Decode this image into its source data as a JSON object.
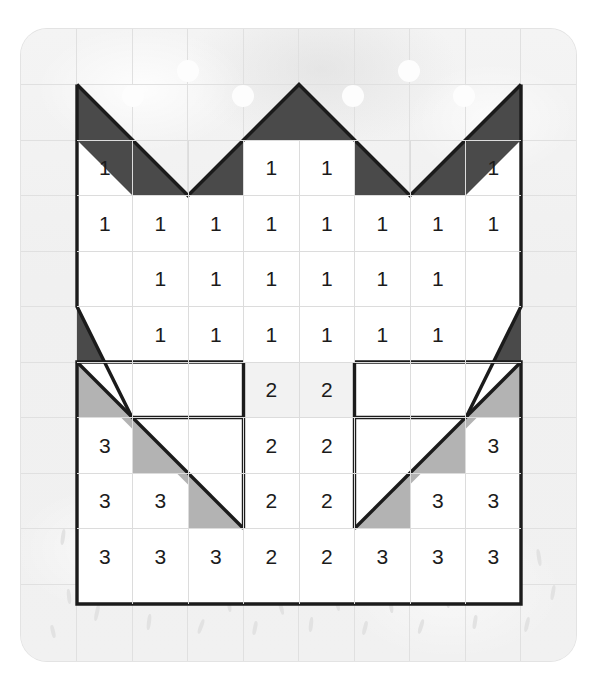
{
  "worksheet": {
    "title": "Crown colour-by-number grid",
    "grid": {
      "cols": 10,
      "rows": 12,
      "cell_px": 55.5,
      "origin_x": 21.5,
      "origin_y": 29
    },
    "colors": {
      "paper": "#f2f2f2",
      "grid_line": "#e0e0e0",
      "outline": "#1b1b1b",
      "dark_fill": "#4a4a4a",
      "light_fill": "#b3b3b3",
      "cell_fill": "#ffffff",
      "digit": "#1b1b1b"
    },
    "legend_values": [
      "1",
      "2",
      "3"
    ],
    "cells": [
      {
        "r": 2,
        "c": 1,
        "v": "1"
      },
      {
        "r": 2,
        "c": 4,
        "v": "1"
      },
      {
        "r": 2,
        "c": 5,
        "v": "1"
      },
      {
        "r": 2,
        "c": 8,
        "v": "1"
      },
      {
        "r": 3,
        "c": 1,
        "v": "1"
      },
      {
        "r": 3,
        "c": 2,
        "v": "1"
      },
      {
        "r": 3,
        "c": 3,
        "v": "1"
      },
      {
        "r": 3,
        "c": 4,
        "v": "1"
      },
      {
        "r": 3,
        "c": 5,
        "v": "1"
      },
      {
        "r": 3,
        "c": 6,
        "v": "1"
      },
      {
        "r": 3,
        "c": 7,
        "v": "1"
      },
      {
        "r": 3,
        "c": 8,
        "v": "1"
      },
      {
        "r": 4,
        "c": 2,
        "v": "1"
      },
      {
        "r": 4,
        "c": 3,
        "v": "1"
      },
      {
        "r": 4,
        "c": 4,
        "v": "1"
      },
      {
        "r": 4,
        "c": 5,
        "v": "1"
      },
      {
        "r": 4,
        "c": 6,
        "v": "1"
      },
      {
        "r": 4,
        "c": 7,
        "v": "1"
      },
      {
        "r": 5,
        "c": 2,
        "v": "1"
      },
      {
        "r": 5,
        "c": 3,
        "v": "1"
      },
      {
        "r": 5,
        "c": 4,
        "v": "1"
      },
      {
        "r": 5,
        "c": 5,
        "v": "1"
      },
      {
        "r": 5,
        "c": 6,
        "v": "1"
      },
      {
        "r": 5,
        "c": 7,
        "v": "1"
      },
      {
        "r": 6,
        "c": 4,
        "v": "2"
      },
      {
        "r": 6,
        "c": 5,
        "v": "2"
      },
      {
        "r": 7,
        "c": 1,
        "v": "3"
      },
      {
        "r": 7,
        "c": 4,
        "v": "2"
      },
      {
        "r": 7,
        "c": 5,
        "v": "2"
      },
      {
        "r": 7,
        "c": 8,
        "v": "3"
      },
      {
        "r": 8,
        "c": 1,
        "v": "3"
      },
      {
        "r": 8,
        "c": 2,
        "v": "3"
      },
      {
        "r": 8,
        "c": 4,
        "v": "2"
      },
      {
        "r": 8,
        "c": 5,
        "v": "2"
      },
      {
        "r": 8,
        "c": 7,
        "v": "3"
      },
      {
        "r": 8,
        "c": 8,
        "v": "3"
      },
      {
        "r": 9,
        "c": 1,
        "v": "3"
      },
      {
        "r": 9,
        "c": 2,
        "v": "3"
      },
      {
        "r": 9,
        "c": 3,
        "v": "3"
      },
      {
        "r": 9,
        "c": 4,
        "v": "2"
      },
      {
        "r": 9,
        "c": 5,
        "v": "2"
      },
      {
        "r": 9,
        "c": 6,
        "v": "3"
      },
      {
        "r": 9,
        "c": 7,
        "v": "3"
      },
      {
        "r": 9,
        "c": 8,
        "v": "3"
      }
    ],
    "white_cells": [
      {
        "r": 2,
        "c": 1
      },
      {
        "r": 2,
        "c": 4
      },
      {
        "r": 2,
        "c": 5
      },
      {
        "r": 2,
        "c": 8
      },
      {
        "r": 3,
        "c": 1
      },
      {
        "r": 3,
        "c": 2
      },
      {
        "r": 3,
        "c": 3
      },
      {
        "r": 3,
        "c": 4
      },
      {
        "r": 3,
        "c": 5
      },
      {
        "r": 3,
        "c": 6
      },
      {
        "r": 3,
        "c": 7
      },
      {
        "r": 3,
        "c": 8
      },
      {
        "r": 4,
        "c": 2
      },
      {
        "r": 4,
        "c": 3
      },
      {
        "r": 4,
        "c": 4
      },
      {
        "r": 4,
        "c": 5
      },
      {
        "r": 4,
        "c": 6
      },
      {
        "r": 4,
        "c": 7
      },
      {
        "r": 5,
        "c": 2
      },
      {
        "r": 5,
        "c": 3
      },
      {
        "r": 5,
        "c": 4
      },
      {
        "r": 5,
        "c": 5
      },
      {
        "r": 5,
        "c": 6
      },
      {
        "r": 5,
        "c": 7
      },
      {
        "r": 6,
        "c": 4
      },
      {
        "r": 6,
        "c": 5
      },
      {
        "r": 7,
        "c": 1
      },
      {
        "r": 7,
        "c": 4
      },
      {
        "r": 7,
        "c": 5
      },
      {
        "r": 7,
        "c": 8
      },
      {
        "r": 8,
        "c": 1
      },
      {
        "r": 8,
        "c": 2
      },
      {
        "r": 8,
        "c": 4
      },
      {
        "r": 8,
        "c": 5
      },
      {
        "r": 8,
        "c": 7
      },
      {
        "r": 8,
        "c": 8
      },
      {
        "r": 9,
        "c": 1
      },
      {
        "r": 9,
        "c": 2
      },
      {
        "r": 9,
        "c": 3
      },
      {
        "r": 9,
        "c": 4
      },
      {
        "r": 9,
        "c": 5
      },
      {
        "r": 9,
        "c": 6
      },
      {
        "r": 9,
        "c": 7
      },
      {
        "r": 9,
        "c": 8
      }
    ],
    "bubbles": [
      {
        "cx": 133,
        "cy": 96,
        "r": 11
      },
      {
        "cx": 188,
        "cy": 71,
        "r": 11
      },
      {
        "cx": 243,
        "cy": 96,
        "r": 11
      },
      {
        "cx": 353,
        "cy": 96,
        "r": 11
      },
      {
        "cx": 409,
        "cy": 71,
        "r": 11
      },
      {
        "cx": 464,
        "cy": 96,
        "r": 11
      }
    ]
  }
}
